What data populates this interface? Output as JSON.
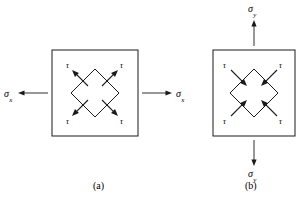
{
  "figure": {
    "type": "mechanics-stress-element-diagram",
    "line_color": "#1a1a1a",
    "background_color": "#ffffff",
    "panels": [
      {
        "id": "a",
        "caption": "(a)",
        "caption_x": 93,
        "caption_y": 181,
        "square": {
          "x": 52,
          "y": 50,
          "width": 86,
          "height": 86
        },
        "diamond": {
          "cx": 95,
          "cy": 93,
          "rx": 24,
          "ry": 24
        },
        "normal_stress": {
          "symbol": "σ",
          "subscript": "x",
          "orientation": "horizontal",
          "sense": "tension-outward",
          "arrows": [
            {
              "name": "left-sigma-x-arrow",
              "x1": 48,
              "y1": 93,
              "x2": 18,
              "y2": 93,
              "label_x": 4,
              "label_y": 89
            },
            {
              "name": "right-sigma-x-arrow",
              "x1": 142,
              "y1": 93,
              "x2": 172,
              "y2": 93,
              "label_x": 176,
              "label_y": 89
            }
          ]
        },
        "shear_arrows": {
          "symbol": "τ",
          "direction": "outward",
          "items": [
            {
              "name": "shear-arrow-top-left",
              "x1": 88,
              "y1": 86,
              "x2": 72,
              "y2": 70,
              "label_x": 66,
              "label_y": 62
            },
            {
              "name": "shear-arrow-top-right",
              "x1": 102,
              "y1": 86,
              "x2": 118,
              "y2": 70,
              "label_x": 120,
              "label_y": 62
            },
            {
              "name": "shear-arrow-bottom-left",
              "x1": 88,
              "y1": 100,
              "x2": 72,
              "y2": 116,
              "label_x": 66,
              "label_y": 118
            },
            {
              "name": "shear-arrow-bottom-right",
              "x1": 102,
              "y1": 100,
              "x2": 118,
              "y2": 116,
              "label_x": 120,
              "label_y": 118
            }
          ]
        }
      },
      {
        "id": "b",
        "caption": "(b)",
        "caption_x": 245,
        "caption_y": 181,
        "square": {
          "x": 213,
          "y": 50,
          "width": 82,
          "height": 86
        },
        "diamond": {
          "cx": 254,
          "cy": 93,
          "rx": 24,
          "ry": 24
        },
        "normal_stress": {
          "symbol": "σ",
          "subscript": "y",
          "orientation": "vertical",
          "sense": "tension-outward",
          "arrows": [
            {
              "name": "top-sigma-y-arrow",
              "x1": 254,
              "y1": 46,
              "x2": 254,
              "y2": 20,
              "label_x": 248,
              "label_y": 4
            },
            {
              "name": "bottom-sigma-y-arrow",
              "x1": 254,
              "y1": 140,
              "x2": 254,
              "y2": 166,
              "label_x": 248,
              "label_y": 169
            }
          ]
        },
        "shear_arrows": {
          "symbol": "τ",
          "direction": "inward",
          "items": [
            {
              "name": "shear-arrow-top-left",
              "x1": 231,
              "y1": 70,
              "x2": 247,
              "y2": 86,
              "label_x": 223,
              "label_y": 62
            },
            {
              "name": "shear-arrow-top-right",
              "x1": 277,
              "y1": 70,
              "x2": 261,
              "y2": 86,
              "label_x": 279,
              "label_y": 62
            },
            {
              "name": "shear-arrow-bottom-left",
              "x1": 231,
              "y1": 116,
              "x2": 247,
              "y2": 100,
              "label_x": 223,
              "label_y": 118
            },
            {
              "name": "shear-arrow-bottom-right",
              "x1": 277,
              "y1": 116,
              "x2": 261,
              "y2": 100,
              "label_x": 279,
              "label_y": 118
            }
          ]
        }
      }
    ]
  }
}
